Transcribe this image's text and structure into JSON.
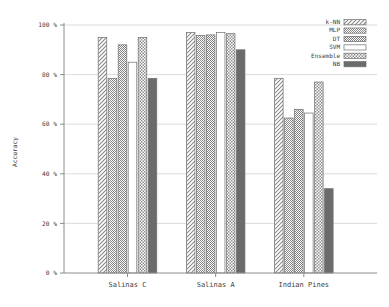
{
  "chart_data": {
    "type": "bar",
    "title": "",
    "xlabel": "",
    "ylabel": "Accuracy",
    "ylim": [
      0,
      100
    ],
    "grid": true,
    "legend_position": "top-right",
    "categories": [
      "Salinas C",
      "Salinas A",
      "Indian Pines"
    ],
    "ytick_labels": [
      "0 %",
      "20 %",
      "40 %",
      "60 %",
      "80 %",
      "100 %"
    ],
    "ytick_values": [
      0,
      20,
      40,
      60,
      80,
      100
    ],
    "series": [
      {
        "name": "k-NN",
        "pattern": "diagonal-hatch",
        "color": "#d9d9d9",
        "values": [
          95.0,
          97.0,
          78.5
        ]
      },
      {
        "name": "MLP",
        "pattern": "fine-checker",
        "color": "#a6a6a6",
        "values": [
          78.5,
          95.8,
          62.5
        ]
      },
      {
        "name": "DT",
        "pattern": "dense-checker",
        "color": "#9e9e9e",
        "values": [
          92.0,
          96.0,
          66.0
        ]
      },
      {
        "name": "SVM",
        "pattern": "solid-white",
        "color": "#ffffff",
        "values": [
          85.0,
          97.0,
          64.5
        ]
      },
      {
        "name": "Ensemble",
        "pattern": "coarse-checker",
        "color": "#bdbdbd",
        "values": [
          95.0,
          96.5,
          77.0
        ]
      },
      {
        "name": "NB",
        "pattern": "solid-dark",
        "color": "#636363",
        "values": [
          78.5,
          90.0,
          34.0
        ]
      }
    ]
  },
  "legend": {
    "entries": [
      {
        "label": "k-NN"
      },
      {
        "label": "MLP"
      },
      {
        "label": "DT"
      },
      {
        "label": "SVM"
      },
      {
        "label": "Ensemble"
      },
      {
        "label": "NB"
      }
    ]
  }
}
